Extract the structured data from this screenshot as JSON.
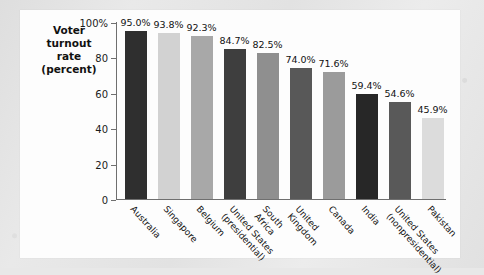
{
  "chart_data": {
    "type": "bar",
    "title": "",
    "subtitle": "",
    "xlabel": "",
    "ylabel": "Voter turnout rate (percent)",
    "ylabel_lines": [
      "Voter",
      "turnout",
      "rate",
      "(percent)"
    ],
    "ylim": [
      0,
      100
    ],
    "yticks": [
      0,
      20,
      40,
      60,
      80,
      100
    ],
    "ytick_labels": [
      "0",
      "20",
      "40",
      "60",
      "80",
      "100%"
    ],
    "grid": false,
    "legend": "none",
    "categories": [
      "Australia",
      "Singapore",
      "Belgium",
      "United States (presidential)",
      "South Africa",
      "United Kingdom",
      "Canada",
      "India",
      "United States (nonpresidential)",
      "Pakistan"
    ],
    "category_lines": [
      [
        "Australia"
      ],
      [
        "Singapore"
      ],
      [
        "Belgium"
      ],
      [
        "United States",
        "(presidential)"
      ],
      [
        "South",
        "Africa"
      ],
      [
        "United",
        "Kingdom"
      ],
      [
        "Canada"
      ],
      [
        "India"
      ],
      [
        "United States",
        "(nonpresidential)"
      ],
      [
        "Pakistan"
      ]
    ],
    "values": [
      95.0,
      93.8,
      92.3,
      84.7,
      82.5,
      74.0,
      71.6,
      59.4,
      54.6,
      45.9
    ],
    "value_labels": [
      "95.0%",
      "93.8%",
      "92.3%",
      "84.7%",
      "82.5%",
      "74.0%",
      "71.6%",
      "59.4%",
      "54.6%",
      "45.9%"
    ],
    "bar_colors": [
      "#2f2f2f",
      "#d2d2d2",
      "#a8a8a8",
      "#3e3e3e",
      "#8f8f8f",
      "#585858",
      "#9b9b9b",
      "#272727",
      "#595959",
      "#dcdcdc"
    ]
  },
  "colors": {
    "page_background": "#e5e5e5",
    "panel_background": "#fdfdfd",
    "axis": "#6f6f6f",
    "text": "#111111"
  }
}
